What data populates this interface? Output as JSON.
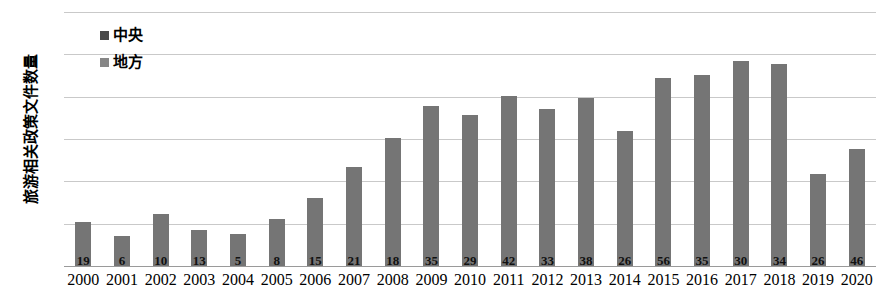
{
  "chart_data": {
    "type": "bar",
    "title": "",
    "xlabel": "",
    "ylabel": "旅游相关政策文件数量",
    "ylim": [
      0,
      600
    ],
    "yticks": [
      0,
      100,
      200,
      300,
      400,
      500,
      600
    ],
    "grid": true,
    "legend_position": "top-left",
    "categories": [
      "2000",
      "2001",
      "2002",
      "2003",
      "2004",
      "2005",
      "2006",
      "2007",
      "2008",
      "2009",
      "2010",
      "2011",
      "2012",
      "2013",
      "2014",
      "2015",
      "2016",
      "2017",
      "2018",
      "2019",
      "2020"
    ],
    "series": [
      {
        "name": "中央",
        "color": "#4a4a4a",
        "values": [
          19,
          6,
          10,
          13,
          5,
          8,
          15,
          21,
          18,
          35,
          29,
          42,
          33,
          38,
          26,
          56,
          35,
          30,
          34,
          26,
          46
        ]
      },
      {
        "name": "地方",
        "color": "#757575",
        "values": [
          103,
          70,
          122,
          84,
          76,
          111,
          160,
          234,
          303,
          378,
          357,
          402,
          372,
          397,
          320,
          443,
          452,
          484,
          478,
          217,
          277
        ]
      }
    ]
  },
  "axis": {
    "y_tick_labels": [
      "600",
      "500",
      "400",
      "300",
      "200",
      "100",
      "0"
    ],
    "y_axis_title": "旅游相关政策文件数量"
  },
  "legend": {
    "items": [
      {
        "label": "中央",
        "color": "#4a4a4a"
      },
      {
        "label": "地方",
        "color": "#868686"
      }
    ]
  },
  "colors": {
    "bar": "#757575",
    "gridline": "#c9c9c9",
    "axis": "#9a9a9a",
    "text": "#000000"
  }
}
